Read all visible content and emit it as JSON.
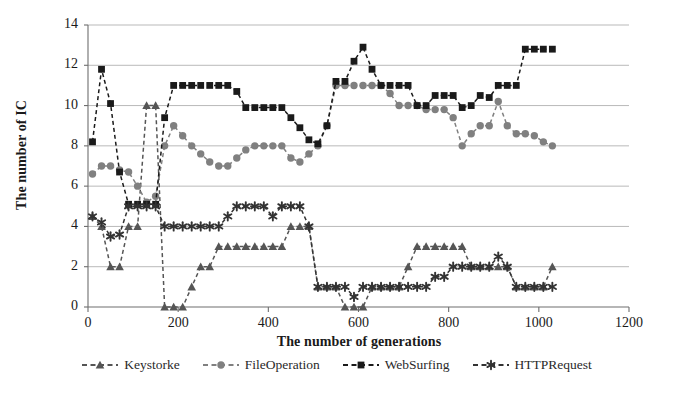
{
  "chart_data": {
    "type": "line",
    "title": "",
    "xlabel": "The number of generations",
    "ylabel": "The number of IC",
    "xlim": [
      0,
      1200
    ],
    "ylim": [
      0,
      14
    ],
    "xticks": [
      0,
      200,
      400,
      600,
      800,
      1000,
      1200
    ],
    "yticks": [
      0,
      2,
      4,
      6,
      8,
      10,
      12,
      14
    ],
    "grid": "horizontal",
    "legend_position": "bottom",
    "series": [
      {
        "name": "Keystorke",
        "marker": "triangle",
        "color": "#555555",
        "linestyle": "dashed",
        "x": [
          10,
          30,
          50,
          70,
          90,
          110,
          130,
          150,
          170,
          190,
          210,
          230,
          250,
          270,
          290,
          310,
          330,
          350,
          370,
          390,
          410,
          430,
          450,
          470,
          490,
          510,
          530,
          550,
          570,
          590,
          610,
          630,
          650,
          670,
          690,
          710,
          730,
          750,
          770,
          790,
          810,
          830,
          850,
          870,
          890,
          910,
          930,
          950,
          970,
          990,
          1010,
          1030
        ],
        "y": [
          4.5,
          4,
          2,
          2,
          4,
          4,
          10,
          10,
          0,
          0,
          0,
          1,
          2,
          2,
          3,
          3,
          3,
          3,
          3,
          3,
          3,
          3,
          4,
          4,
          4,
          1,
          1,
          1,
          0,
          0,
          0,
          1,
          1,
          1,
          1,
          2,
          3,
          3,
          3,
          3,
          3,
          3,
          2,
          2,
          2,
          2,
          2,
          1,
          1,
          1,
          1,
          2
        ]
      },
      {
        "name": "FileOperation",
        "marker": "circle",
        "color": "#808080",
        "linestyle": "dashed",
        "x": [
          10,
          30,
          50,
          70,
          90,
          110,
          130,
          150,
          170,
          190,
          210,
          230,
          250,
          270,
          290,
          310,
          330,
          350,
          370,
          390,
          410,
          430,
          450,
          470,
          490,
          510,
          530,
          550,
          570,
          590,
          610,
          630,
          650,
          670,
          690,
          710,
          730,
          750,
          770,
          790,
          810,
          830,
          850,
          870,
          890,
          910,
          930,
          950,
          970,
          990,
          1010,
          1030
        ],
        "y": [
          6.6,
          7,
          7,
          6.8,
          6.7,
          6,
          5.2,
          5.5,
          8,
          9,
          8.5,
          8,
          7.6,
          7.2,
          7,
          7,
          7.4,
          7.8,
          8,
          8,
          8,
          8,
          7.4,
          7.2,
          7.6,
          8,
          9,
          11,
          11,
          11,
          11,
          11,
          11,
          10.6,
          10,
          10,
          10,
          9.8,
          9.8,
          9.8,
          9.4,
          8,
          8.6,
          9,
          9,
          10.2,
          9,
          8.6,
          8.6,
          8.5,
          8.2,
          8
        ]
      },
      {
        "name": "WebSurfing",
        "marker": "square",
        "color": "#1a1a1a",
        "linestyle": "dashed",
        "x": [
          10,
          30,
          50,
          70,
          90,
          110,
          130,
          150,
          170,
          190,
          210,
          230,
          250,
          270,
          290,
          310,
          330,
          350,
          370,
          390,
          410,
          430,
          450,
          470,
          490,
          510,
          530,
          550,
          570,
          590,
          610,
          630,
          650,
          670,
          690,
          710,
          730,
          750,
          770,
          790,
          810,
          830,
          850,
          870,
          890,
          910,
          930,
          950,
          970,
          990,
          1010,
          1030
        ],
        "y": [
          8.2,
          11.8,
          10.1,
          6.7,
          5.1,
          5.1,
          5.1,
          5.1,
          9.4,
          11,
          11,
          11,
          11,
          11,
          11,
          11,
          10.7,
          9.9,
          9.9,
          9.9,
          9.9,
          9.9,
          9.4,
          8.9,
          8.3,
          8.1,
          9,
          11.2,
          11.2,
          12.2,
          12.9,
          11.8,
          11,
          11,
          11,
          11,
          10,
          10,
          10.5,
          10.5,
          10.5,
          9.9,
          10,
          10.5,
          10.4,
          11,
          11,
          11,
          12.8,
          12.8,
          12.8,
          12.8
        ]
      },
      {
        "name": "HTTPRequest",
        "marker": "asterisk",
        "color": "#333333",
        "linestyle": "dashed",
        "x": [
          10,
          30,
          50,
          70,
          90,
          110,
          130,
          150,
          170,
          190,
          210,
          230,
          250,
          270,
          290,
          310,
          330,
          350,
          370,
          390,
          410,
          430,
          450,
          470,
          490,
          510,
          530,
          550,
          570,
          590,
          610,
          630,
          650,
          670,
          690,
          710,
          730,
          750,
          770,
          790,
          810,
          830,
          850,
          870,
          890,
          910,
          930,
          950,
          970,
          990,
          1010,
          1030
        ],
        "y": [
          4.5,
          4.2,
          3.5,
          3.6,
          5,
          5,
          5,
          5,
          4,
          4,
          4,
          4,
          4,
          4,
          4,
          4.5,
          5,
          5,
          5,
          5,
          4.5,
          5,
          5,
          5,
          4,
          1,
          1,
          1,
          1,
          0.5,
          1,
          1,
          1,
          1,
          1,
          1,
          1,
          1,
          1.5,
          1.5,
          2,
          2,
          2,
          2,
          2,
          2.5,
          2,
          1,
          1,
          1,
          1,
          1
        ]
      }
    ]
  },
  "axes": {
    "ylabel": "The number of IC",
    "xlabel": "The number of generations",
    "ytick_labels": [
      "14",
      "12",
      "10",
      "8",
      "6",
      "4",
      "2",
      "0"
    ],
    "xtick_labels": [
      "0",
      "200",
      "400",
      "600",
      "800",
      "1000",
      "1200"
    ]
  },
  "legend": {
    "items": [
      {
        "label": "Keystorke",
        "marker": "triangle-marker-icon",
        "color": "#555555"
      },
      {
        "label": "FileOperation",
        "marker": "circle-marker-icon",
        "color": "#808080"
      },
      {
        "label": "WebSurfing",
        "marker": "square-marker-icon",
        "color": "#1a1a1a"
      },
      {
        "label": "HTTPRequest",
        "marker": "asterisk-marker-icon",
        "color": "#333333"
      }
    ]
  },
  "style": {
    "grid_color": "#b9b9b9",
    "axis_color": "#6e6e6e",
    "background": "#ffffff"
  }
}
